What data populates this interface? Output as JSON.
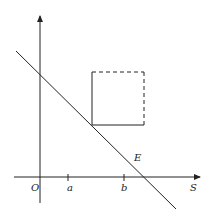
{
  "diagram": {
    "type": "economics-line-diagram",
    "axes": {
      "origin_label": "O",
      "x_axis_label": "S",
      "y_axis_label": ""
    },
    "ticks": [
      {
        "label": "a"
      },
      {
        "label": "b"
      }
    ],
    "line_label": "E",
    "shapes": [
      {
        "name": "square",
        "solid_sides": [
          "left",
          "bottom"
        ],
        "dashed_sides": [
          "top",
          "right"
        ]
      }
    ],
    "colors": {
      "stroke": "#222222",
      "background": "#ffffff"
    }
  }
}
